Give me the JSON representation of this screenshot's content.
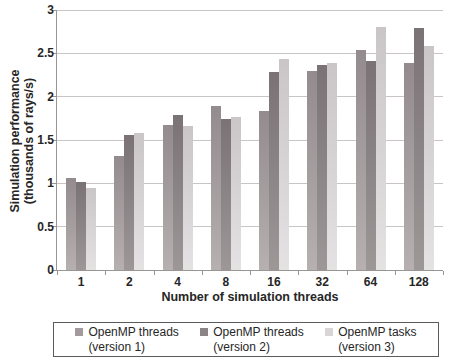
{
  "figure": {
    "background": "#ffffff",
    "gridline_color": "#c9c5c5",
    "axis_color": "#9a9595",
    "text_color": "#262626"
  },
  "chart_data": {
    "type": "bar",
    "title": "",
    "xlabel": "Number of simulation threads",
    "ylabel": "Simulation performance (thousands of rays/s)",
    "ylabel_line1": "Simulation performance",
    "ylabel_line2": "(thousands of rays/s)",
    "categories": [
      "1",
      "2",
      "4",
      "8",
      "16",
      "32",
      "64",
      "128"
    ],
    "y_ticks": [
      0,
      0.5,
      1,
      1.5,
      2,
      2.5,
      3
    ],
    "y_tick_labels": [
      "0",
      "0.5",
      "1",
      "1.5",
      "2",
      "2.5",
      "3"
    ],
    "ylim": [
      0,
      3
    ],
    "grid": true,
    "legend_position": "bottom",
    "series": [
      {
        "name": "OpenMP threads (version 1)",
        "legend_line1": "OpenMP threads",
        "legend_line2": "(version 1)",
        "values": [
          1.06,
          1.31,
          1.67,
          1.89,
          1.83,
          2.3,
          2.54,
          2.39
        ],
        "color_top": "#938b8d",
        "color_bottom": "#b6b0b1",
        "swatch_color": "#a29a9c"
      },
      {
        "name": "OpenMP threads (version 2)",
        "legend_line1": "OpenMP threads",
        "legend_line2": "(version 2)",
        "values": [
          1.02,
          1.56,
          1.79,
          1.74,
          2.28,
          2.37,
          2.41,
          2.79
        ],
        "color_top": "#7a7274",
        "color_bottom": "#9d9798",
        "swatch_color": "#8b8486"
      },
      {
        "name": "OpenMP tasks (version 3)",
        "legend_line1": "OpenMP tasks",
        "legend_line2": "(version 3)",
        "values": [
          0.95,
          1.58,
          1.66,
          1.77,
          2.43,
          2.39,
          2.8,
          2.58
        ],
        "color_top": "#cac5c6",
        "color_bottom": "#e5e2e3",
        "swatch_color": "#d9d5d6"
      }
    ]
  }
}
